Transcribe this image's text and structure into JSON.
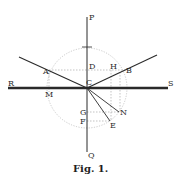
{
  "figure": {
    "caption": "Fig. 1.",
    "labels": {
      "P": "P",
      "Q": "Q",
      "R": "R",
      "S": "S",
      "A": "A",
      "B": "B",
      "C": "C",
      "D": "D",
      "H": "H",
      "M": "M",
      "G": "G",
      "N": "N",
      "F": "F",
      "E": "E"
    },
    "colors": {
      "ink": "#2a2a2a",
      "construction": "#9a9a9a",
      "background": "#ffffff"
    }
  }
}
